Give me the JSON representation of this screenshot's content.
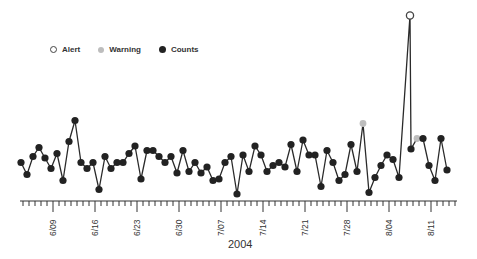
{
  "legend": {
    "alert": "Alert",
    "warning": "Warning",
    "counts": "Counts"
  },
  "colors": {
    "line": "#2a2a2a",
    "counts": "#222222",
    "warning": "#bdbdbd",
    "alert_stroke": "#444444",
    "axis": "#333333"
  },
  "axis": {
    "year_label": "2004",
    "ticks": [
      "6/09",
      "6/16",
      "6/23",
      "6/30",
      "7/07",
      "7/14",
      "7/21",
      "7/28",
      "8/04",
      "8/11"
    ]
  },
  "chart_data": {
    "type": "line",
    "title": "",
    "xlabel": "2004",
    "ylabel": "",
    "grid": false,
    "legend_position": "top-left",
    "legend": [
      "Alert",
      "Warning",
      "Counts"
    ],
    "x_tick_labels": [
      "6/09",
      "6/16",
      "6/23",
      "6/30",
      "7/07",
      "7/14",
      "7/21",
      "7/28",
      "8/04",
      "8/11"
    ],
    "x_start": "6/04",
    "x_step": "1 day",
    "series": [
      {
        "name": "Counts",
        "points": [
          {
            "x": "6/04",
            "y": 25
          },
          {
            "x": "6/05",
            "y": 17
          },
          {
            "x": "6/06",
            "y": 29
          },
          {
            "x": "6/07",
            "y": 35
          },
          {
            "x": "6/08",
            "y": 28
          },
          {
            "x": "6/09",
            "y": 21
          },
          {
            "x": "6/10",
            "y": 31
          },
          {
            "x": "6/11",
            "y": 13
          },
          {
            "x": "6/12",
            "y": 39
          },
          {
            "x": "6/13",
            "y": 53
          },
          {
            "x": "6/14",
            "y": 25
          },
          {
            "x": "6/15",
            "y": 21
          },
          {
            "x": "6/16",
            "y": 25
          },
          {
            "x": "6/17",
            "y": 7
          },
          {
            "x": "6/18",
            "y": 29
          },
          {
            "x": "6/19",
            "y": 21
          },
          {
            "x": "6/20",
            "y": 25
          },
          {
            "x": "6/21",
            "y": 25
          },
          {
            "x": "6/22",
            "y": 31
          },
          {
            "x": "6/23",
            "y": 36
          },
          {
            "x": "6/24",
            "y": 14
          },
          {
            "x": "6/25",
            "y": 33
          },
          {
            "x": "6/26",
            "y": 33
          },
          {
            "x": "6/27",
            "y": 29
          },
          {
            "x": "6/28",
            "y": 25
          },
          {
            "x": "6/29",
            "y": 29
          },
          {
            "x": "6/30",
            "y": 18
          },
          {
            "x": "7/01",
            "y": 33
          },
          {
            "x": "7/02",
            "y": 19
          },
          {
            "x": "7/03",
            "y": 25
          },
          {
            "x": "7/04",
            "y": 18
          },
          {
            "x": "7/05",
            "y": 22
          },
          {
            "x": "7/06",
            "y": 13
          },
          {
            "x": "7/07",
            "y": 14
          },
          {
            "x": "7/08",
            "y": 25
          },
          {
            "x": "7/09",
            "y": 29
          },
          {
            "x": "7/10",
            "y": 4
          },
          {
            "x": "7/11",
            "y": 30
          },
          {
            "x": "7/12",
            "y": 19
          },
          {
            "x": "7/13",
            "y": 36
          },
          {
            "x": "7/14",
            "y": 30
          },
          {
            "x": "7/15",
            "y": 19
          },
          {
            "x": "7/16",
            "y": 23
          },
          {
            "x": "7/17",
            "y": 25
          },
          {
            "x": "7/18",
            "y": 22
          },
          {
            "x": "7/19",
            "y": 37
          },
          {
            "x": "7/20",
            "y": 19
          },
          {
            "x": "7/21",
            "y": 40
          },
          {
            "x": "7/22",
            "y": 30
          },
          {
            "x": "7/23",
            "y": 30
          },
          {
            "x": "7/24",
            "y": 9
          },
          {
            "x": "7/25",
            "y": 33
          },
          {
            "x": "7/26",
            "y": 25
          },
          {
            "x": "7/27",
            "y": 13
          },
          {
            "x": "7/28",
            "y": 17
          },
          {
            "x": "7/29",
            "y": 37
          },
          {
            "x": "7/30",
            "y": 19
          },
          {
            "x": "7/31",
            "y": 51,
            "status": "warning"
          },
          {
            "x": "8/01",
            "y": 5
          },
          {
            "x": "8/02",
            "y": 15
          },
          {
            "x": "8/03",
            "y": 23
          },
          {
            "x": "8/04",
            "y": 30
          },
          {
            "x": "8/05",
            "y": 27
          },
          {
            "x": "8/06",
            "y": 15
          },
          {
            "x": "8/07",
            "y": 123,
            "status": "alert"
          },
          {
            "x": "8/08",
            "y": 34
          },
          {
            "x": "8/09",
            "y": 41,
            "status": "warning"
          },
          {
            "x": "8/10",
            "y": 41
          },
          {
            "x": "8/11",
            "y": 23
          },
          {
            "x": "8/12",
            "y": 13
          },
          {
            "x": "8/13",
            "y": 41
          },
          {
            "x": "8/14",
            "y": 20
          }
        ]
      }
    ],
    "ylim": [
      0,
      130
    ],
    "y_pixel_map": {
      "value_zero_px": 200,
      "px_per_unit": 1.5
    }
  }
}
